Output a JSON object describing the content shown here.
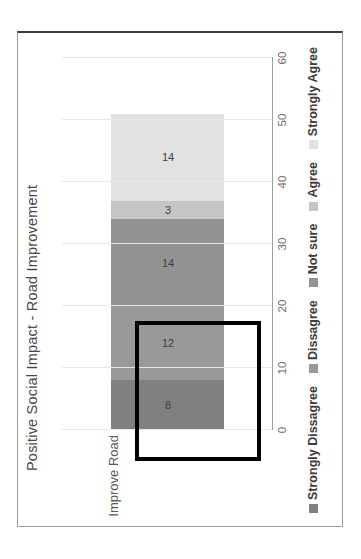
{
  "chart_data": {
    "type": "bar",
    "orientation": "horizontal-rotated",
    "stacked": true,
    "title": "Positive Social Impact - Road Improvement",
    "xlabel": "",
    "ylabel": "",
    "categories": [
      "Improve Road"
    ],
    "series": [
      {
        "name": "Strongly Dissagree",
        "values": [
          8
        ],
        "color": "#808080"
      },
      {
        "name": "Dissagree",
        "values": [
          12
        ],
        "color": "#999999"
      },
      {
        "name": "Not sure",
        "values": [
          14
        ],
        "color": "#939393"
      },
      {
        "name": "Agree",
        "values": [
          3
        ],
        "color": "#c5c5c5"
      },
      {
        "name": "Strongly Agree",
        "values": [
          14
        ],
        "color": "#e2e2e2"
      }
    ],
    "data_labels": [
      "8",
      "12",
      "14",
      "3",
      "14"
    ],
    "total": 51,
    "axis_ticks": [
      "0",
      "10",
      "20",
      "30",
      "40",
      "50",
      "60"
    ],
    "axis_range": [
      0,
      60
    ],
    "grid": true,
    "legend_position": "bottom",
    "annotation": {
      "type": "highlight-rectangle",
      "covers_segments": [
        "Strongly Dissagree",
        "Dissagree"
      ],
      "color": "#000000"
    }
  },
  "legend": [
    {
      "label": "Strongly Dissagree",
      "color": "#808080"
    },
    {
      "label": "Dissagree",
      "color": "#999999"
    },
    {
      "label": "Not sure",
      "color": "#939393"
    },
    {
      "label": "Agree",
      "color": "#c5c5c5"
    },
    {
      "label": "Strongly Agree",
      "color": "#e2e2e2"
    }
  ],
  "ticks": [
    "0",
    "10",
    "20",
    "30",
    "40",
    "50",
    "60"
  ],
  "category_label": "Improve Road",
  "title": "Positive Social Impact - Road Improvement"
}
